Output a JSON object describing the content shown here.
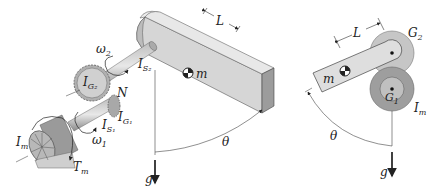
{
  "left_figure": {
    "labels": {
      "length": "L",
      "mass": "m",
      "omega2": "ω",
      "omega2_sub": "2",
      "omega1": "ω",
      "omega1_sub": "1",
      "I_S2": "I",
      "I_S2_sub": "S₂",
      "I_G2": "I",
      "I_G2_sub": "G₂",
      "N": "N",
      "I_S1": "I",
      "I_S1_sub": "S₁",
      "I_G1": "I",
      "I_G1_sub": "G₁",
      "I_m": "I",
      "I_m_sub": "m",
      "T_m": "T",
      "T_m_sub": "m",
      "theta": "θ",
      "gravity": "g"
    }
  },
  "right_figure": {
    "labels": {
      "length": "L",
      "mass": "m",
      "G2": "G",
      "G2_sub": "2",
      "G1": "G",
      "G1_sub": "1",
      "I_m": "I",
      "I_m_sub": "m",
      "theta": "θ",
      "gravity": "g"
    }
  },
  "colors": {
    "beam_top": "#e6e6e6",
    "beam_front": "#cfcfcf",
    "beam_end": "#9a9a9a",
    "gear_light": "#c8c8c8",
    "gear_dark": "#a0a0a0",
    "line": "#333333"
  }
}
